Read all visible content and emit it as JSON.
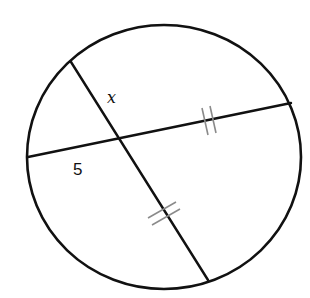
{
  "diagram": {
    "type": "geometry-intersecting-chords",
    "colors": {
      "stroke": "#111111",
      "tick": "#8a8a8a",
      "background": "#ffffff"
    },
    "circle": {
      "cx": 164,
      "cy": 157,
      "rx": 137,
      "ry": 132
    },
    "chords": [
      {
        "name": "chord-horizontal",
        "x1": 28,
        "y1": 157,
        "x2": 291,
        "y2": 103
      },
      {
        "name": "chord-diagonal",
        "x1": 71,
        "y1": 62,
        "x2": 208,
        "y2": 280
      }
    ],
    "intersection": {
      "x": 121,
      "y": 139
    },
    "labels": {
      "x_segment": "x",
      "left_segment": "5"
    },
    "congruence_marks": {
      "horizontal_right_segment": "double-tick",
      "diagonal_lower_segment": "double-tick"
    }
  }
}
